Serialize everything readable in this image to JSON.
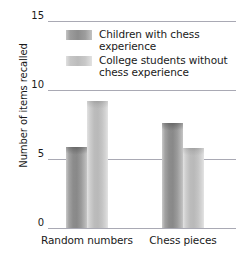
{
  "chart_data": {
    "type": "bar",
    "title": "",
    "xlabel": "",
    "ylabel": "Number of items recalled",
    "categories": [
      "Random numbers",
      "Chess pieces"
    ],
    "series": [
      {
        "name": "Children with chess experience",
        "color": "#8d8d8d",
        "values": [
          5.9,
          7.6
        ]
      },
      {
        "name": "College students without chess experience",
        "color": "#bcbcbc",
        "values": [
          9.2,
          5.8
        ]
      }
    ],
    "ylim": [
      0,
      15
    ],
    "yticks": [
      0,
      5,
      10,
      15
    ],
    "ytick_labels": [
      "0",
      "5",
      "10",
      "15"
    ],
    "grid": true,
    "grid_color": "#a9a9b4",
    "legend_position": "upper-center"
  },
  "axes": {
    "y_title": "Number of items recalled"
  },
  "legend": {
    "entries": [
      {
        "label": "Children with chess experience",
        "swatch": "dark"
      },
      {
        "label": "College students without chess experience",
        "swatch": "light"
      }
    ]
  }
}
